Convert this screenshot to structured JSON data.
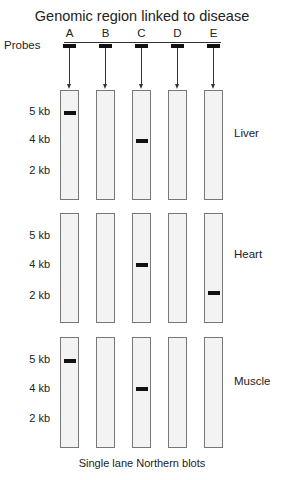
{
  "title": "Genomic region linked to disease",
  "probes_label": "Probes",
  "footer": "Single lane Northern blots",
  "probes": [
    {
      "label": "A",
      "x": 60
    },
    {
      "label": "B",
      "x": 96
    },
    {
      "label": "C",
      "x": 132
    },
    {
      "label": "D",
      "x": 168
    },
    {
      "label": "E",
      "x": 204
    }
  ],
  "size_labels": [
    "5 kb",
    "4 kb",
    "2 kb"
  ],
  "panels": [
    {
      "tissue": "Liver",
      "top": 90,
      "bottom": 200,
      "label_ys": [
        112,
        140,
        171
      ],
      "tissue_y": 134,
      "bands": [
        {
          "lane": 0,
          "size": "5 kb",
          "y": 111
        },
        {
          "lane": 2,
          "size": "4 kb",
          "y": 139
        }
      ]
    },
    {
      "tissue": "Heart",
      "top": 213,
      "bottom": 323,
      "label_ys": [
        236,
        265,
        296
      ],
      "tissue_y": 255,
      "bands": [
        {
          "lane": 2,
          "size": "4 kb",
          "y": 263
        },
        {
          "lane": 4,
          "size": "2 kb",
          "y": 291
        }
      ]
    },
    {
      "tissue": "Muscle",
      "top": 337,
      "bottom": 448,
      "label_ys": [
        360,
        389,
        419
      ],
      "tissue_y": 382,
      "bands": [
        {
          "lane": 0,
          "size": "5 kb",
          "y": 359
        },
        {
          "lane": 2,
          "size": "4 kb",
          "y": 387
        }
      ]
    }
  ]
}
